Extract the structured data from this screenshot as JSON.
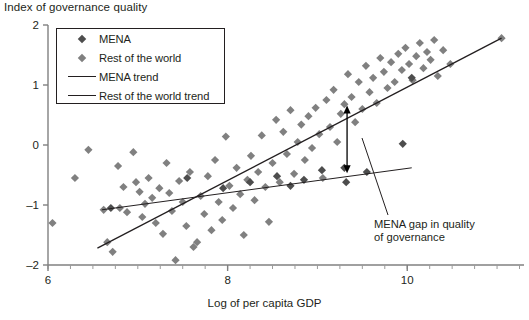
{
  "chart_data": {
    "type": "scatter",
    "title": "",
    "ylabel": "Index of governance quality",
    "xlabel": "Log of per capita GDP",
    "xlim": [
      6,
      11.3
    ],
    "ylim": [
      -2,
      2
    ],
    "xticks": [
      "6",
      "8",
      "10"
    ],
    "xtick_values": [
      6,
      8,
      10
    ],
    "yticks": [
      "2",
      "1",
      "0",
      "-1",
      "-2"
    ],
    "ytick_values": [
      2,
      1,
      0,
      -1,
      -2
    ],
    "grid": false,
    "legend_position": "top-left",
    "legend": [
      {
        "label": "MENA",
        "key": "diamond",
        "color": "#4d4d4d"
      },
      {
        "label": "Rest of the world",
        "key": "diamond",
        "color": "#808080"
      },
      {
        "label": "MENA trend",
        "key": "line-thin",
        "color": "#231f20"
      },
      {
        "label": "Rest of the world trend",
        "key": "line-thick",
        "color": "#231f20"
      }
    ],
    "series": [
      {
        "name": "Rest of the world",
        "marker": "diamond",
        "color": "#808080",
        "points": [
          [
            6.05,
            -1.3
          ],
          [
            6.3,
            -0.55
          ],
          [
            6.45,
            -0.08
          ],
          [
            6.62,
            -1.08
          ],
          [
            6.66,
            -1.62
          ],
          [
            6.72,
            -1.78
          ],
          [
            6.78,
            -0.35
          ],
          [
            6.8,
            -1.05
          ],
          [
            6.84,
            -0.7
          ],
          [
            6.88,
            -1.12
          ],
          [
            6.95,
            -0.12
          ],
          [
            6.98,
            -0.62
          ],
          [
            7.02,
            -0.78
          ],
          [
            7.05,
            -1.2
          ],
          [
            7.08,
            -0.98
          ],
          [
            7.12,
            -0.55
          ],
          [
            7.16,
            -0.88
          ],
          [
            7.2,
            -1.3
          ],
          [
            7.24,
            -0.72
          ],
          [
            7.28,
            -1.48
          ],
          [
            7.32,
            -0.3
          ],
          [
            7.35,
            -0.8
          ],
          [
            7.38,
            -1.1
          ],
          [
            7.42,
            -1.92
          ],
          [
            7.46,
            -0.6
          ],
          [
            7.5,
            -0.95
          ],
          [
            7.54,
            -1.35
          ],
          [
            7.58,
            -0.45
          ],
          [
            7.62,
            -1.7
          ],
          [
            7.66,
            -1.62
          ],
          [
            7.7,
            -0.85
          ],
          [
            7.74,
            -1.15
          ],
          [
            7.78,
            -0.52
          ],
          [
            7.82,
            -1.42
          ],
          [
            7.86,
            -0.25
          ],
          [
            7.9,
            -0.95
          ],
          [
            7.94,
            -1.25
          ],
          [
            7.98,
            0.14
          ],
          [
            8.02,
            -0.68
          ],
          [
            8.06,
            -1.05
          ],
          [
            8.1,
            -0.38
          ],
          [
            8.14,
            -0.82
          ],
          [
            8.18,
            -1.5
          ],
          [
            8.22,
            -0.58
          ],
          [
            8.26,
            -0.18
          ],
          [
            8.3,
            -0.92
          ],
          [
            8.34,
            -0.45
          ],
          [
            8.38,
            0.16
          ],
          [
            8.42,
            -0.7
          ],
          [
            8.46,
            -1.28
          ],
          [
            8.5,
            -0.3
          ],
          [
            8.54,
            0.42
          ],
          [
            8.58,
            -0.62
          ],
          [
            8.62,
            0.22
          ],
          [
            8.66,
            -0.15
          ],
          [
            8.7,
            0.58
          ],
          [
            8.74,
            -0.48
          ],
          [
            8.78,
            0.05
          ],
          [
            8.82,
            0.34
          ],
          [
            8.86,
            -0.25
          ],
          [
            8.9,
            0.48
          ],
          [
            8.94,
            -0.05
          ],
          [
            8.98,
            0.62
          ],
          [
            9.02,
            0.18
          ],
          [
            9.06,
            -0.55
          ],
          [
            9.1,
            0.75
          ],
          [
            9.14,
            0.3
          ],
          [
            9.18,
            0.92
          ],
          [
            9.22,
            0.05
          ],
          [
            9.26,
            0.52
          ],
          [
            9.3,
            0.68
          ],
          [
            9.34,
            1.18
          ],
          [
            9.38,
            0.8
          ],
          [
            9.42,
            0.38
          ],
          [
            9.46,
            1.05
          ],
          [
            9.5,
            0.6
          ],
          [
            9.54,
            1.32
          ],
          [
            9.58,
            0.88
          ],
          [
            9.62,
            1.12
          ],
          [
            9.66,
            0.7
          ],
          [
            9.7,
            1.45
          ],
          [
            9.74,
            1.22
          ],
          [
            9.78,
            0.95
          ],
          [
            9.82,
            1.38
          ],
          [
            9.86,
            1.05
          ],
          [
            9.9,
            1.52
          ],
          [
            9.94,
            1.25
          ],
          [
            9.98,
            1.62
          ],
          [
            10.02,
            1.35
          ],
          [
            10.06,
            1.08
          ],
          [
            10.1,
            1.48
          ],
          [
            10.14,
            1.7
          ],
          [
            10.18,
            1.28
          ],
          [
            10.22,
            1.55
          ],
          [
            10.26,
            1.42
          ],
          [
            10.3,
            1.75
          ],
          [
            10.34,
            1.15
          ],
          [
            10.4,
            1.58
          ],
          [
            10.48,
            1.35
          ],
          [
            11.05,
            1.78
          ]
        ]
      },
      {
        "name": "MENA",
        "marker": "diamond",
        "color": "#4d4d4d",
        "points": [
          [
            6.7,
            -1.05
          ],
          [
            7.55,
            -0.55
          ],
          [
            7.95,
            -0.72
          ],
          [
            8.25,
            -0.62
          ],
          [
            8.55,
            -0.52
          ],
          [
            8.7,
            -0.68
          ],
          [
            8.85,
            -0.58
          ],
          [
            9.05,
            -0.42
          ],
          [
            9.3,
            -0.38
          ],
          [
            9.32,
            -0.62
          ],
          [
            9.55,
            -0.45
          ],
          [
            9.95,
            0.02
          ],
          [
            10.05,
            1.12
          ]
        ]
      }
    ],
    "trend_lines": [
      {
        "name": "Rest of the world trend",
        "style": "thick",
        "x0": 6.55,
        "y0": -1.72,
        "x1": 11.05,
        "y1": 1.78
      },
      {
        "name": "MENA trend",
        "style": "thin",
        "x0": 6.6,
        "y0": -1.08,
        "x1": 10.05,
        "y1": -0.38
      }
    ],
    "annotations": [
      {
        "name": "mena-gap",
        "text_line1": "MENA gap in quality",
        "text_line2": "of governance",
        "arrow": {
          "x": 9.33,
          "y_low": -0.47,
          "y_high": 0.66,
          "type": "double-headed"
        }
      }
    ]
  }
}
